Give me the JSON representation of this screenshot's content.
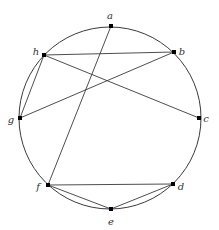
{
  "diagram": {
    "type": "circle-graph",
    "circle": {
      "cx": 110,
      "cy": 118,
      "r": 91
    },
    "colors": {
      "stroke": "#3a3a3a",
      "vertex": "#000000",
      "label": "#333333",
      "background": "#ffffff"
    },
    "vertices": [
      {
        "id": "a",
        "label": "a",
        "x": 111,
        "y": 26,
        "lx": 110,
        "ly": 19
      },
      {
        "id": "b",
        "label": "b",
        "x": 174,
        "y": 52,
        "lx": 182,
        "ly": 55
      },
      {
        "id": "c",
        "label": "c",
        "x": 199,
        "y": 118,
        "lx": 206,
        "ly": 122
      },
      {
        "id": "d",
        "label": "d",
        "x": 173,
        "y": 184,
        "lx": 181,
        "ly": 190
      },
      {
        "id": "e",
        "label": "e",
        "x": 111,
        "y": 209,
        "lx": 111,
        "ly": 225
      },
      {
        "id": "f",
        "label": "f",
        "x": 48,
        "y": 185,
        "lx": 38,
        "ly": 190
      },
      {
        "id": "g",
        "label": "g",
        "x": 20,
        "y": 118,
        "lx": 11,
        "ly": 123
      },
      {
        "id": "h",
        "label": "h",
        "x": 44,
        "y": 55,
        "lx": 36,
        "ly": 55
      }
    ],
    "edges": [
      [
        "a",
        "f"
      ],
      [
        "h",
        "b"
      ],
      [
        "h",
        "c"
      ],
      [
        "h",
        "g"
      ],
      [
        "g",
        "b"
      ],
      [
        "f",
        "d"
      ],
      [
        "f",
        "e"
      ],
      [
        "e",
        "d"
      ]
    ]
  }
}
